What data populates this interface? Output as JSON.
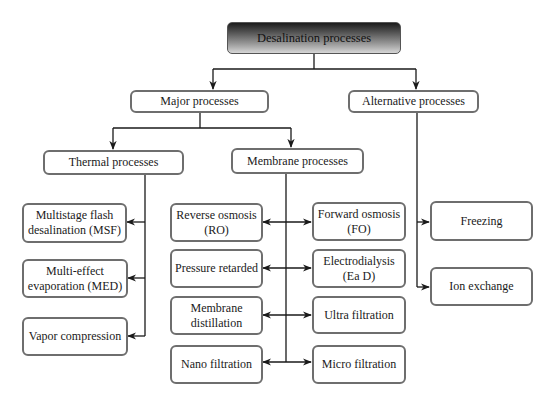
{
  "root": {
    "label": "Desalination processes"
  },
  "level1": {
    "major": {
      "label": "Major processes"
    },
    "alternative": {
      "label": "Alternative processes"
    }
  },
  "level2": {
    "thermal": {
      "label": "Thermal processes"
    },
    "membrane": {
      "label": "Membrane processes"
    }
  },
  "thermal_items": [
    {
      "label": "Multistage flash desalination (MSF)"
    },
    {
      "label": "Multi-effect evaporation (MED)"
    },
    {
      "label": "Vapor compression"
    }
  ],
  "membrane_left_items": [
    {
      "label": "Reverse osmosis (RO)"
    },
    {
      "label": "Pressure retarded"
    },
    {
      "label": "Membrane distillation"
    },
    {
      "label": "Nano filtration"
    }
  ],
  "membrane_right_items": [
    {
      "label": "Forward osmosis (FO)"
    },
    {
      "label": "Electrodialysis (Ea D)"
    },
    {
      "label": "Ultra filtration"
    },
    {
      "label": "Micro filtration"
    }
  ],
  "alternative_items": [
    {
      "label": "Freezing"
    },
    {
      "label": "Ion exchange"
    }
  ],
  "colors": {
    "line": "#1a1a1a",
    "box_border": "#6e6e6e",
    "root_dark": "#1c1c1c",
    "root_light": "#d6d6d6"
  }
}
